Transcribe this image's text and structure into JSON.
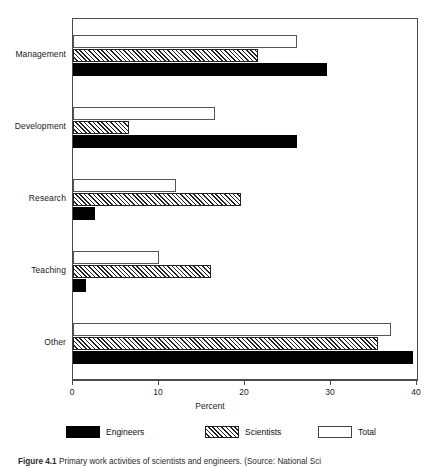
{
  "chart_data": {
    "type": "bar",
    "orientation": "horizontal",
    "title": "",
    "xlabel": "Percent",
    "ylabel": "",
    "xlim": [
      0,
      40
    ],
    "xticks": [
      0,
      10,
      20,
      30,
      40
    ],
    "xtick_labels": [
      "0",
      "10",
      "20",
      "30",
      "40"
    ],
    "grid": false,
    "legend_position": "bottom",
    "categories": [
      "Management",
      "Development",
      "Research",
      "Teaching",
      "Other"
    ],
    "series": [
      {
        "name": "Engineers",
        "style": "solid-black",
        "values": [
          29.5,
          26.0,
          2.5,
          1.5,
          39.5
        ]
      },
      {
        "name": "Scientists",
        "style": "hatched",
        "values": [
          21.5,
          6.5,
          19.5,
          16.0,
          35.5
        ]
      },
      {
        "name": "Total",
        "style": "white-outline",
        "values": [
          26.0,
          16.5,
          12.0,
          10.0,
          37.0
        ]
      }
    ]
  },
  "axis": {
    "x_title": "Percent",
    "ticks": [
      {
        "value": 0,
        "label": "0"
      },
      {
        "value": 10,
        "label": "10"
      },
      {
        "value": 20,
        "label": "20"
      },
      {
        "value": 30,
        "label": "30"
      },
      {
        "value": 40,
        "label": "40"
      }
    ]
  },
  "categories": [
    {
      "label": "Management"
    },
    {
      "label": "Development"
    },
    {
      "label": "Research"
    },
    {
      "label": "Teaching"
    },
    {
      "label": "Other"
    }
  ],
  "legend": [
    {
      "label": "Engineers",
      "style": "engineers"
    },
    {
      "label": "Scientists",
      "style": "scientists"
    },
    {
      "label": "Total",
      "style": "total"
    }
  ],
  "caption": {
    "figure_number": "Figure 4.1",
    "text": "Primary work activities of scientists and engineers. (Source: National Sci"
  }
}
